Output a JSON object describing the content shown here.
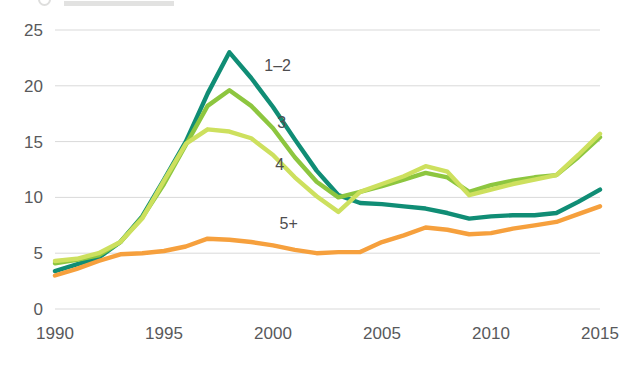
{
  "chart_data": {
    "type": "line",
    "title": "",
    "subtitle": "",
    "xlabel": "",
    "ylabel": "",
    "xlim": [
      1990,
      2015
    ],
    "ylim": [
      0,
      25
    ],
    "grid": true,
    "legend_position": "inline-labels",
    "x": [
      1990,
      1991,
      1992,
      1993,
      1994,
      1995,
      1996,
      1997,
      1998,
      1999,
      2000,
      2001,
      2002,
      2003,
      2004,
      2005,
      2006,
      2007,
      2008,
      2009,
      2010,
      2011,
      2012,
      2013,
      2014,
      2015
    ],
    "y_ticks": [
      "0",
      "5",
      "10",
      "15",
      "20",
      "25"
    ],
    "x_ticks": [
      "1990",
      "1995",
      "2000",
      "2005",
      "2010",
      "2015"
    ],
    "series": [
      {
        "name": "1-2",
        "label": "1–2",
        "color": "#108d75",
        "label_x": 1999.6,
        "label_y": 21.3,
        "values": [
          3.4,
          4.0,
          4.6,
          6.0,
          8.3,
          11.6,
          15.0,
          19.3,
          23.0,
          20.7,
          18.1,
          15.2,
          12.4,
          10.2,
          9.5,
          9.4,
          9.2,
          9.0,
          8.6,
          8.1,
          8.3,
          8.4,
          8.4,
          8.6,
          9.6,
          10.7
        ]
      },
      {
        "name": "3",
        "label": "3",
        "color": "#8dc63f",
        "label_x": 2000.2,
        "label_y": 16.2,
        "values": [
          4.1,
          4.4,
          4.8,
          6.0,
          8.2,
          11.2,
          14.7,
          18.2,
          19.6,
          18.2,
          16.2,
          13.6,
          11.4,
          10.0,
          10.5,
          11.0,
          11.6,
          12.2,
          11.8,
          10.5,
          11.1,
          11.5,
          11.8,
          12.0,
          13.6,
          15.4
        ]
      },
      {
        "name": "4",
        "label": "4",
        "color": "#cde05e",
        "label_x": 2000.1,
        "label_y": 12.5,
        "values": [
          4.3,
          4.5,
          5.0,
          6.0,
          8.1,
          11.5,
          14.8,
          16.1,
          15.9,
          15.3,
          13.8,
          11.8,
          10.1,
          8.7,
          10.5,
          11.2,
          11.9,
          12.8,
          12.3,
          10.2,
          10.7,
          11.2,
          11.6,
          12.0,
          13.8,
          15.7
        ]
      },
      {
        "name": "5+",
        "label": "5+",
        "color": "#f6a03d",
        "label_x": 2000.3,
        "label_y": 7.2,
        "values": [
          3.0,
          3.6,
          4.3,
          4.9,
          5.0,
          5.2,
          5.6,
          6.3,
          6.2,
          6.0,
          5.7,
          5.3,
          5.0,
          5.1,
          5.1,
          6.0,
          6.6,
          7.3,
          7.1,
          6.7,
          6.8,
          7.2,
          7.5,
          7.8,
          8.5,
          9.2
        ]
      }
    ]
  },
  "axis": {
    "y_tick_labels": [
      "25",
      "20",
      "15",
      "10",
      "5",
      "0"
    ],
    "x_tick_labels": [
      "1990",
      "1995",
      "2000",
      "2005",
      "2010",
      "2015"
    ]
  }
}
